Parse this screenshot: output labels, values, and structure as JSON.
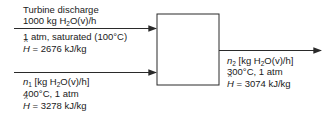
{
  "diagram": {
    "type": "process flowchart",
    "unit": {
      "shape": "box",
      "label": ""
    },
    "streams": [
      {
        "id": "input_1",
        "direction": "in",
        "line1": "Turbine discharge",
        "line2_prefix": "1000 kg H",
        "line2_sub": "2",
        "line2_suffix": "O(v)/h",
        "line3": "1 atm, saturated (100°C)",
        "enthalpy_symbol": "H",
        "enthalpy_value": " = 2676 kJ/kg"
      },
      {
        "id": "input_2",
        "direction": "in",
        "flow_symbol": "n",
        "flow_symbol_sub": "1",
        "line1_prefix": " [kg H",
        "line1_sub": "2",
        "line1_suffix": "O(v)/h]",
        "line2": "400°C, 1 atm",
        "enthalpy_symbol": "H",
        "enthalpy_value": " = 3278 kJ/kg"
      },
      {
        "id": "output_1",
        "direction": "out",
        "flow_symbol": "n",
        "flow_symbol_sub": "2",
        "line1_prefix": " [kg H",
        "line1_sub": "2",
        "line1_suffix": "O(v)/h]",
        "line2": "300°C, 1 atm",
        "enthalpy_symbol": "H",
        "enthalpy_value": " = 3074 kJ/kg"
      }
    ]
  },
  "colors": {
    "line": "#2a2a2a",
    "text": "#1a1a1a",
    "background": "#ffffff"
  }
}
